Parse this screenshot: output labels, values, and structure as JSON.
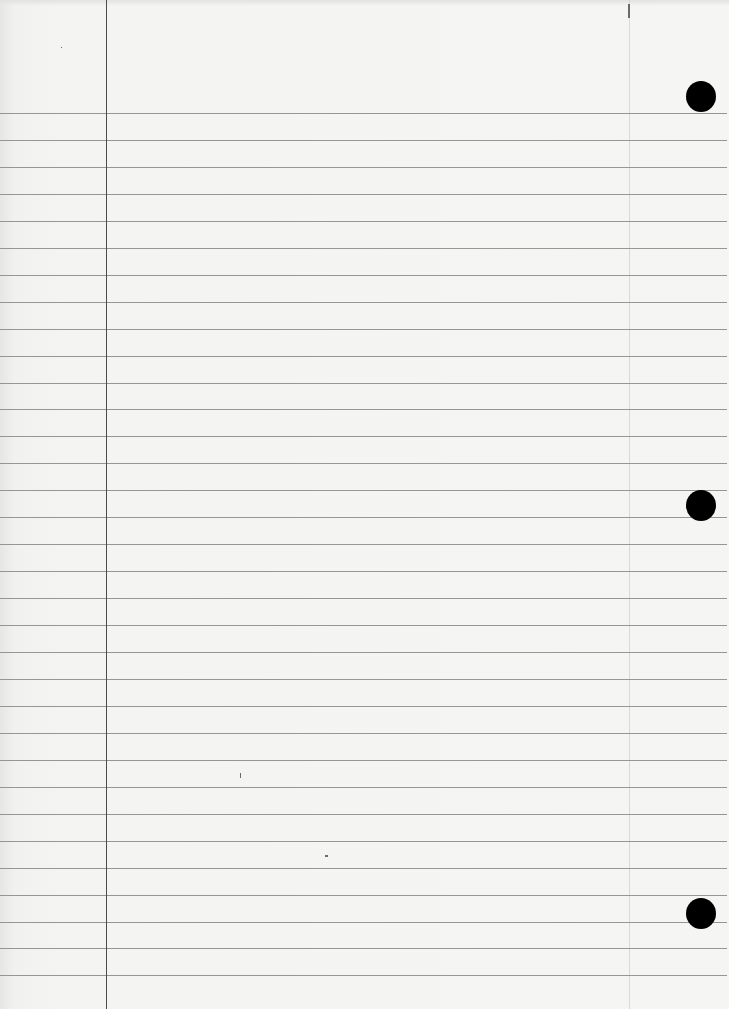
{
  "page": {
    "type": "ruled-notebook-paper",
    "width": 729,
    "height": 1009,
    "background_color": "#f4f4f2",
    "text_content": []
  },
  "margin_line": {
    "x": 106,
    "color": "#4d4d4d"
  },
  "rules": {
    "first_y": 113,
    "spacing": 26.95,
    "count": 33,
    "color": "#8c8c8c",
    "end_x": 727
  },
  "punch_holes": [
    {
      "cx": 701,
      "cy": 96,
      "r": 15
    },
    {
      "cx": 701,
      "cy": 505,
      "r": 15
    },
    {
      "cx": 701,
      "cy": 913,
      "r": 15
    }
  ],
  "marks": [
    {
      "x": 628,
      "y": 4,
      "w": 2,
      "h": 14
    },
    {
      "x": 240,
      "y": 773,
      "w": 1,
      "h": 5
    },
    {
      "x": 325,
      "y": 855,
      "w": 3,
      "h": 2
    },
    {
      "x": 61,
      "y": 47,
      "w": 1,
      "h": 1
    }
  ]
}
